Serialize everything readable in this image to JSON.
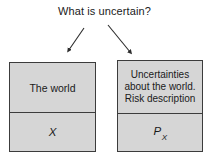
{
  "figure": {
    "title": "What is uncertain?",
    "background_color": "#ffffff",
    "ink_color": "#1a1a1a",
    "box_fill_color": "#d6d6d6",
    "box_border_color": "#3c3c3c"
  },
  "arrows": [
    {
      "name": "arrow-to-world",
      "direction": "down-left",
      "from": [
        84,
        28
      ],
      "to": [
        67,
        53
      ]
    },
    {
      "name": "arrow-to-uncertainty",
      "direction": "down-right",
      "from": [
        108,
        25
      ],
      "to": [
        132,
        55
      ]
    }
  ],
  "panels": [
    {
      "name": "world",
      "top_label": "The world",
      "bottom_symbol": "X",
      "bottom_symbol_subscript": ""
    },
    {
      "name": "uncertainty",
      "top_lines": [
        "Uncertainties",
        "about the world.",
        "Risk description"
      ],
      "bottom_symbol": "P",
      "bottom_symbol_subscript": "X"
    }
  ]
}
